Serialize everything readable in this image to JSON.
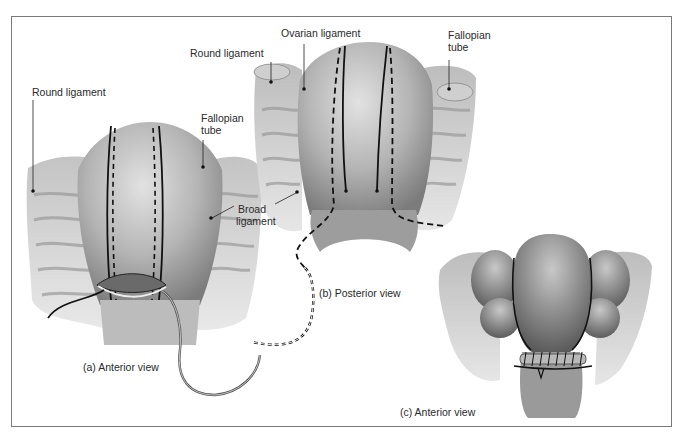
{
  "figure": {
    "panels": [
      {
        "id": "a",
        "caption": "(a)  Anterior view",
        "labels": {
          "round_ligament": "Round ligament",
          "fallopian_tube_line1": "Fallopian",
          "fallopian_tube_line2": "tube",
          "broad_ligament_line1": "Broad",
          "broad_ligament_line2": "ligament"
        }
      },
      {
        "id": "b",
        "caption": "(b)  Posterior view",
        "labels": {
          "round_ligament": "Round ligament",
          "ovarian_ligament": "Ovarian ligament",
          "fallopian_tube_line1": "Fallopian",
          "fallopian_tube_line2": "tube"
        }
      },
      {
        "id": "c",
        "caption": "(c)  Anterior view",
        "labels": {}
      }
    ],
    "colors": {
      "frame": "#7a7a7a",
      "tissue_light": "#d8d8d8",
      "tissue_mid": "#a8a8a8",
      "tissue_dark": "#6e6e6e",
      "incision_line": "#111111"
    }
  }
}
